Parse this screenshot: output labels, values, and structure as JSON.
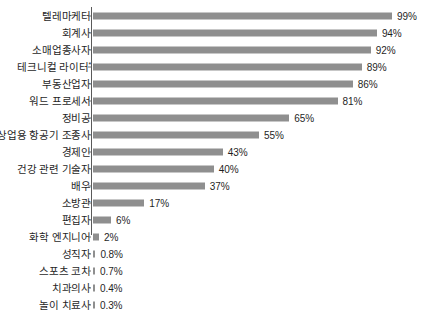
{
  "chart_data": {
    "type": "bar",
    "orientation": "horizontal",
    "title": "",
    "subtitle": "",
    "xlabel": "",
    "ylabel": "",
    "xlim": [
      0,
      100
    ],
    "grid": false,
    "legend": null,
    "value_suffix": "%",
    "bar_color": "#8f8f8f",
    "axis_color": "#5a5a5a",
    "text_color": "#1f1f1f",
    "categories": [
      "텔레마케터",
      "회계사",
      "소매업종사자",
      "테크니컬 라이터",
      "부동산업자",
      "워드 프로세서",
      "정비공",
      "상업용 항공기 조종사",
      "경제인",
      "건강 관련 기술자",
      "배우",
      "소방관",
      "편집자",
      "화학 엔지니어",
      "성직자",
      "스포츠 코치",
      "치과의사",
      "놀이 치료사"
    ],
    "values": [
      99,
      94,
      92,
      89,
      86,
      81,
      65,
      55,
      43,
      40,
      37,
      17,
      6,
      2,
      0.8,
      0.7,
      0.4,
      0.3
    ],
    "value_labels": [
      "99%",
      "94%",
      "92%",
      "89%",
      "86%",
      "81%",
      "65%",
      "55%",
      "43%",
      "40%",
      "37%",
      "17%",
      "6%",
      "2%",
      "0.8%",
      "0.7%",
      "0.4%",
      "0.3%"
    ],
    "annotations": [
      {
        "category": "테크니컬 라이터",
        "marker": "*"
      }
    ]
  }
}
